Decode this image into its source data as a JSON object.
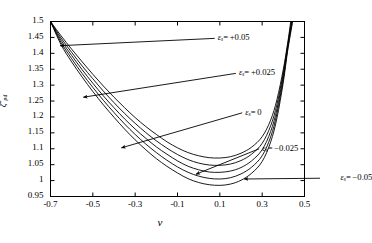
{
  "chart_data": {
    "type": "line",
    "title": "",
    "xlabel": "ν",
    "ylabel_symbol": "ζ",
    "ylabel_sub": "pd",
    "ylabel_sup": "*",
    "xlim": [
      -0.7,
      0.5
    ],
    "ylim": [
      0.95,
      1.5
    ],
    "xticks": [
      "-0.7",
      "-0.5",
      "-0.3",
      "-0.1",
      "0.1",
      "0.3",
      "0.5"
    ],
    "xtick_values": [
      -0.7,
      -0.5,
      -0.3,
      -0.1,
      0.1,
      0.3,
      0.5
    ],
    "yticks": [
      "0.95",
      "1",
      "1.05",
      "1.1",
      "1.15",
      "1.2",
      "1.25",
      "1.3",
      "1.35",
      "1.4",
      "1.45",
      "1.5"
    ],
    "ytick_values": [
      0.95,
      1.0,
      1.05,
      1.1,
      1.15,
      1.2,
      1.25,
      1.3,
      1.35,
      1.4,
      1.45,
      1.5
    ],
    "grid": false,
    "legend_position": "inline-annotations",
    "line_color": "#000000",
    "series": [
      {
        "name": "εs = +0.05",
        "label_symbol": "ε",
        "label_sub": "s",
        "label_value": "= +0.05",
        "eps": 0.05,
        "x": [
          -0.7,
          -0.65,
          -0.6,
          -0.55,
          -0.5,
          -0.45,
          -0.4,
          -0.35,
          -0.3,
          -0.25,
          -0.2,
          -0.15,
          -0.1,
          -0.05,
          0.0,
          0.05,
          0.1,
          0.15,
          0.2,
          0.25,
          0.3,
          0.34,
          0.37,
          0.4,
          0.42,
          0.435
        ],
        "y": [
          1.5,
          1.455,
          1.413,
          1.373,
          1.334,
          1.297,
          1.262,
          1.229,
          1.198,
          1.17,
          1.145,
          1.122,
          1.103,
          1.088,
          1.078,
          1.072,
          1.071,
          1.075,
          1.086,
          1.105,
          1.138,
          1.19,
          1.255,
          1.35,
          1.43,
          1.5
        ]
      },
      {
        "name": "εs = +0.025",
        "label_symbol": "ε",
        "label_sub": "s",
        "label_value": "= +0.025",
        "eps": 0.025,
        "x": [
          -0.7,
          -0.65,
          -0.6,
          -0.55,
          -0.5,
          -0.45,
          -0.4,
          -0.35,
          -0.3,
          -0.25,
          -0.2,
          -0.15,
          -0.1,
          -0.05,
          0.0,
          0.05,
          0.1,
          0.15,
          0.2,
          0.25,
          0.3,
          0.34,
          0.37,
          0.4,
          0.42,
          0.438
        ],
        "y": [
          1.5,
          1.448,
          1.403,
          1.36,
          1.32,
          1.281,
          1.245,
          1.211,
          1.18,
          1.151,
          1.125,
          1.102,
          1.082,
          1.066,
          1.055,
          1.049,
          1.048,
          1.052,
          1.063,
          1.083,
          1.117,
          1.172,
          1.24,
          1.34,
          1.424,
          1.5
        ]
      },
      {
        "name": "εs = 0",
        "label_symbol": "ε",
        "label_sub": "s",
        "label_value": "= 0",
        "eps": 0.0,
        "x": [
          -0.7,
          -0.65,
          -0.6,
          -0.55,
          -0.5,
          -0.45,
          -0.4,
          -0.35,
          -0.3,
          -0.25,
          -0.2,
          -0.15,
          -0.1,
          -0.05,
          0.0,
          0.05,
          0.1,
          0.15,
          0.2,
          0.25,
          0.3,
          0.34,
          0.37,
          0.4,
          0.42,
          0.44
        ],
        "y": [
          1.5,
          1.441,
          1.393,
          1.348,
          1.306,
          1.266,
          1.229,
          1.194,
          1.162,
          1.133,
          1.106,
          1.083,
          1.062,
          1.045,
          1.034,
          1.027,
          1.026,
          1.03,
          1.041,
          1.062,
          1.097,
          1.154,
          1.225,
          1.33,
          1.418,
          1.5
        ]
      },
      {
        "name": "εs = -0.025",
        "label_symbol": "ε",
        "label_sub": "s",
        "label_value": "= −0.025",
        "eps": -0.025,
        "x": [
          -0.7,
          -0.65,
          -0.6,
          -0.55,
          -0.5,
          -0.45,
          -0.4,
          -0.35,
          -0.3,
          -0.25,
          -0.2,
          -0.15,
          -0.1,
          -0.05,
          0.0,
          0.05,
          0.1,
          0.15,
          0.2,
          0.25,
          0.3,
          0.34,
          0.37,
          0.4,
          0.42,
          0.442
        ],
        "y": [
          1.5,
          1.434,
          1.383,
          1.336,
          1.293,
          1.252,
          1.214,
          1.178,
          1.145,
          1.115,
          1.088,
          1.064,
          1.043,
          1.026,
          1.014,
          1.007,
          1.005,
          1.009,
          1.021,
          1.042,
          1.078,
          1.137,
          1.211,
          1.32,
          1.412,
          1.5
        ]
      },
      {
        "name": "εs = -0.05",
        "label_symbol": "ε",
        "label_sub": "s",
        "label_value": "= −0.05",
        "eps": -0.05,
        "x": [
          -0.7,
          -0.65,
          -0.6,
          -0.55,
          -0.5,
          -0.45,
          -0.4,
          -0.35,
          -0.3,
          -0.25,
          -0.2,
          -0.15,
          -0.1,
          -0.05,
          0.0,
          0.05,
          0.1,
          0.15,
          0.2,
          0.25,
          0.3,
          0.34,
          0.37,
          0.4,
          0.42,
          0.444
        ],
        "y": [
          1.5,
          1.427,
          1.373,
          1.325,
          1.28,
          1.238,
          1.199,
          1.162,
          1.128,
          1.097,
          1.069,
          1.045,
          1.024,
          1.006,
          0.994,
          0.987,
          0.985,
          0.989,
          1.001,
          1.023,
          1.06,
          1.121,
          1.197,
          1.31,
          1.406,
          1.5
        ]
      }
    ],
    "annotations": [
      {
        "series": 0,
        "text_x": 0.09,
        "text_y": 1.447,
        "arrow_to_x": -0.655,
        "arrow_to_y": 1.424
      },
      {
        "series": 1,
        "text_x": 0.19,
        "text_y": 1.337,
        "arrow_to_x": -0.545,
        "arrow_to_y": 1.262
      },
      {
        "series": 2,
        "text_x": 0.22,
        "text_y": 1.213,
        "arrow_to_x": -0.365,
        "arrow_to_y": 1.103
      },
      {
        "series": 3,
        "text_x": 0.3,
        "text_y": 1.1,
        "arrow_to_x": -0.013,
        "arrow_to_y": 1.02
      },
      {
        "series": 4,
        "text_x": 0.67,
        "text_y": 1.008,
        "arrow_to_x": 0.215,
        "arrow_to_y": 1.005
      }
    ]
  }
}
